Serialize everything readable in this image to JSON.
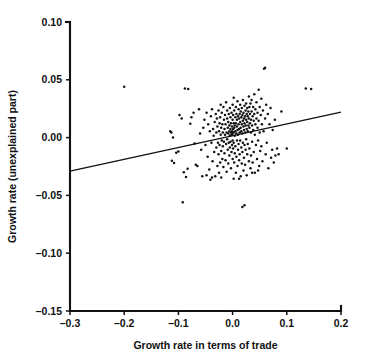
{
  "chart_data": {
    "type": "scatter",
    "title": "",
    "xlabel": "Growth rate in terms of trade",
    "ylabel": "Growth rate (unexplained part)",
    "xlim": [
      -0.3,
      0.2
    ],
    "ylim": [
      -0.15,
      0.1
    ],
    "grid": false,
    "legend": null,
    "xticks": [
      -0.3,
      -0.2,
      -0.1,
      0.0,
      0.1,
      0.2
    ],
    "xtick_labels": [
      "–0.3",
      "–0.2",
      "–0.1",
      "0.0",
      "0.1",
      "0.2"
    ],
    "yticks": [
      0.1,
      0.05,
      0.0,
      -0.05,
      -0.1,
      -0.15
    ],
    "ytick_labels": [
      "0.10",
      "0.05",
      "0.00",
      "–0.05",
      "–0.10",
      "–0.15"
    ],
    "series": [
      {
        "name": "observations",
        "marker": "dot",
        "color": "#121212",
        "points": [
          [
            -0.2,
            0.044
          ],
          [
            -0.092,
            -0.056
          ],
          [
            -0.088,
            0.0425
          ],
          [
            -0.082,
            0.042
          ],
          [
            -0.113,
            0.0045
          ],
          [
            -0.11,
            0.0
          ],
          [
            -0.112,
            -0.02
          ],
          [
            -0.108,
            -0.022
          ],
          [
            -0.104,
            -0.013
          ],
          [
            -0.1,
            -0.012
          ],
          [
            -0.098,
            0.0195
          ],
          [
            -0.094,
            0.0165
          ],
          [
            -0.09,
            -0.03
          ],
          [
            -0.086,
            -0.034
          ],
          [
            -0.083,
            -0.027
          ],
          [
            -0.078,
            0.012
          ],
          [
            -0.076,
            0.0175
          ],
          [
            -0.072,
            0.0215
          ],
          [
            -0.07,
            -0.005
          ],
          [
            -0.068,
            -0.0235
          ],
          [
            -0.065,
            -0.0245
          ],
          [
            -0.062,
            0.0245
          ],
          [
            -0.06,
            0.0035
          ],
          [
            -0.058,
            -0.0105
          ],
          [
            -0.056,
            -0.0335
          ],
          [
            -0.054,
            0.0085
          ],
          [
            -0.052,
            0.0155
          ],
          [
            -0.05,
            -0.0065
          ],
          [
            -0.048,
            0.0215
          ],
          [
            -0.046,
            -0.0165
          ],
          [
            -0.045,
            0.0115
          ],
          [
            -0.043,
            -0.0275
          ],
          [
            -0.042,
            0.0055
          ],
          [
            -0.04,
            0.0185
          ],
          [
            -0.039,
            -0.0045
          ],
          [
            -0.038,
            0.0245
          ],
          [
            -0.037,
            -0.0205
          ],
          [
            -0.036,
            0.0075
          ],
          [
            -0.035,
            0.0015
          ],
          [
            -0.034,
            -0.0125
          ],
          [
            -0.033,
            0.0135
          ],
          [
            -0.032,
            -0.0335
          ],
          [
            -0.031,
            0.0205
          ],
          [
            -0.03,
            0.0045
          ],
          [
            -0.03,
            -0.0085
          ],
          [
            -0.029,
            0.0165
          ],
          [
            -0.028,
            -0.0245
          ],
          [
            -0.028,
            0.0095
          ],
          [
            -0.027,
            -0.0045
          ],
          [
            -0.026,
            0.0235
          ],
          [
            -0.026,
            -0.0145
          ],
          [
            -0.025,
            0.0055
          ],
          [
            -0.025,
            -0.0305
          ],
          [
            -0.024,
            0.0125
          ],
          [
            -0.024,
            -0.0065
          ],
          [
            -0.023,
            0.0175
          ],
          [
            -0.023,
            -0.0215
          ],
          [
            -0.022,
            0.0025
          ],
          [
            -0.022,
            0.0285
          ],
          [
            -0.021,
            -0.0115
          ],
          [
            -0.021,
            0.0085
          ],
          [
            -0.02,
            -0.0025
          ],
          [
            -0.02,
            0.0215
          ],
          [
            -0.019,
            -0.0185
          ],
          [
            -0.019,
            0.0115
          ],
          [
            -0.018,
            0.0045
          ],
          [
            -0.018,
            -0.0075
          ],
          [
            -0.017,
            0.0265
          ],
          [
            -0.017,
            -0.0255
          ],
          [
            -0.016,
            0.0155
          ],
          [
            -0.016,
            -0.0035
          ],
          [
            -0.015,
            0.0075
          ],
          [
            -0.015,
            -0.0135
          ],
          [
            -0.014,
            0.0195
          ],
          [
            -0.014,
            0.0025
          ],
          [
            -0.013,
            -0.0195
          ],
          [
            -0.013,
            0.0115
          ],
          [
            -0.012,
            -0.0055
          ],
          [
            -0.012,
            0.0305
          ],
          [
            -0.011,
            0.0045
          ],
          [
            -0.011,
            -0.0295
          ],
          [
            -0.01,
            0.0165
          ],
          [
            -0.01,
            -0.0015
          ],
          [
            -0.01,
            0.0235
          ],
          [
            -0.009,
            -0.0105
          ],
          [
            -0.009,
            0.0085
          ],
          [
            -0.008,
            0.0035
          ],
          [
            -0.008,
            -0.0225
          ],
          [
            -0.008,
            0.0135
          ],
          [
            -0.007,
            -0.0045
          ],
          [
            -0.007,
            0.0205
          ],
          [
            -0.006,
            0.0055
          ],
          [
            -0.006,
            -0.0155
          ],
          [
            -0.006,
            0.0105
          ],
          [
            -0.005,
            0.0015
          ],
          [
            -0.005,
            0.0255
          ],
          [
            -0.005,
            -0.0085
          ],
          [
            -0.004,
            0.0075
          ],
          [
            -0.004,
            0.0175
          ],
          [
            -0.004,
            -0.0035
          ],
          [
            -0.003,
            0.0045
          ],
          [
            -0.003,
            0.0125
          ],
          [
            -0.003,
            -0.0265
          ],
          [
            -0.002,
            0.0215
          ],
          [
            -0.002,
            0.0025
          ],
          [
            -0.002,
            -0.0125
          ],
          [
            -0.001,
            0.0095
          ],
          [
            -0.001,
            0.0055
          ],
          [
            -0.001,
            -0.0065
          ],
          [
            0.0,
            0.0155
          ],
          [
            0.0,
            0.0035
          ],
          [
            0.0,
            -0.0025
          ],
          [
            0.0,
            0.0285
          ],
          [
            0.0,
            -0.0185
          ],
          [
            0.001,
            0.0075
          ],
          [
            0.001,
            0.0195
          ],
          [
            0.001,
            -0.0095
          ],
          [
            0.002,
            0.0045
          ],
          [
            0.002,
            0.0125
          ],
          [
            0.002,
            -0.0045
          ],
          [
            0.002,
            0.0345
          ],
          [
            0.003,
            0.0085
          ],
          [
            0.003,
            -0.0215
          ],
          [
            0.003,
            0.0235
          ],
          [
            0.004,
            0.0015
          ],
          [
            0.004,
            0.0105
          ],
          [
            0.004,
            -0.0135
          ],
          [
            0.005,
            0.0175
          ],
          [
            0.005,
            0.0055
          ],
          [
            0.005,
            -0.0075
          ],
          [
            0.006,
            0.0125
          ],
          [
            0.006,
            0.0265
          ],
          [
            0.006,
            -0.0305
          ],
          [
            0.007,
            0.0035
          ],
          [
            0.007,
            0.0205
          ],
          [
            0.007,
            -0.0165
          ],
          [
            0.008,
            0.0095
          ],
          [
            0.008,
            0.0155
          ],
          [
            0.008,
            -0.0025
          ],
          [
            0.009,
            0.0065
          ],
          [
            0.009,
            0.0315
          ],
          [
            0.009,
            -0.0245
          ],
          [
            0.01,
            0.0185
          ],
          [
            0.01,
            0.0025
          ],
          [
            0.01,
            -0.0105
          ],
          [
            0.011,
            0.0115
          ],
          [
            0.011,
            0.0245
          ],
          [
            0.011,
            -0.0055
          ],
          [
            0.012,
            0.0075
          ],
          [
            0.012,
            0.0165
          ],
          [
            0.012,
            -0.0195
          ],
          [
            0.013,
            0.0045
          ],
          [
            0.013,
            0.0205
          ],
          [
            0.013,
            -0.0145
          ],
          [
            0.014,
            0.0135
          ],
          [
            0.014,
            0.0285
          ],
          [
            0.014,
            -0.0025
          ],
          [
            0.015,
            0.0085
          ],
          [
            0.015,
            0.0225
          ],
          [
            0.015,
            -0.0335
          ],
          [
            0.016,
            0.0175
          ],
          [
            0.016,
            0.0055
          ],
          [
            0.016,
            -0.0085
          ],
          [
            0.017,
            0.0115
          ],
          [
            0.017,
            0.0255
          ],
          [
            0.017,
            -0.0225
          ],
          [
            0.018,
            0.0035
          ],
          [
            0.018,
            0.0195
          ],
          [
            0.018,
            -0.0125
          ],
          [
            0.019,
            0.0145
          ],
          [
            0.019,
            0.0325
          ],
          [
            0.019,
            -0.0045
          ],
          [
            0.02,
            0.0095
          ],
          [
            0.02,
            0.0215
          ],
          [
            0.02,
            -0.0285
          ],
          [
            0.021,
            0.0165
          ],
          [
            0.021,
            0.0065
          ],
          [
            0.021,
            -0.0175
          ],
          [
            0.022,
            0.0125
          ],
          [
            0.022,
            0.0275
          ],
          [
            0.022,
            -0.0065
          ],
          [
            0.023,
            0.0185
          ],
          [
            0.023,
            0.0045
          ],
          [
            0.023,
            -0.0235
          ],
          [
            0.024,
            0.0235
          ],
          [
            0.024,
            0.0105
          ],
          [
            0.024,
            -0.0105
          ],
          [
            0.025,
            0.0155
          ],
          [
            0.025,
            0.0295
          ],
          [
            0.025,
            -0.0015
          ],
          [
            0.026,
            0.0075
          ],
          [
            0.026,
            0.0205
          ],
          [
            0.026,
            -0.0325
          ],
          [
            0.027,
            0.0135
          ],
          [
            0.027,
            0.0255
          ],
          [
            0.027,
            -0.0145
          ],
          [
            0.028,
            0.0185
          ],
          [
            0.028,
            0.0055
          ],
          [
            0.028,
            -0.0055
          ],
          [
            0.029,
            0.0225
          ],
          [
            0.029,
            0.0105
          ],
          [
            0.03,
            0.0165
          ],
          [
            0.03,
            0.0355
          ],
          [
            0.03,
            -0.0205
          ],
          [
            0.031,
            0.0085
          ],
          [
            0.031,
            0.0265
          ],
          [
            0.031,
            -0.0095
          ],
          [
            0.032,
            0.0205
          ],
          [
            0.032,
            0.0125
          ],
          [
            0.033,
            0.0295
          ],
          [
            0.033,
            -0.0265
          ],
          [
            0.034,
            0.0155
          ],
          [
            0.034,
            0.0045
          ],
          [
            0.034,
            -0.0155
          ],
          [
            0.035,
            0.0225
          ],
          [
            0.035,
            0.0325
          ],
          [
            0.036,
            0.0105
          ],
          [
            0.036,
            -0.0035
          ],
          [
            0.037,
            0.0185
          ],
          [
            0.037,
            -0.0215
          ],
          [
            0.038,
            0.0265
          ],
          [
            0.038,
            0.0065
          ],
          [
            0.039,
            0.0145
          ],
          [
            0.039,
            -0.0125
          ],
          [
            0.04,
            0.0205
          ],
          [
            0.04,
            0.0375
          ],
          [
            0.041,
            0.0025
          ],
          [
            0.041,
            -0.0305
          ],
          [
            0.042,
            0.0245
          ],
          [
            0.042,
            0.0115
          ],
          [
            0.043,
            -0.0065
          ],
          [
            0.044,
            0.0165
          ],
          [
            0.044,
            0.0305
          ],
          [
            0.045,
            -0.0185
          ],
          [
            0.046,
            0.0085
          ],
          [
            0.046,
            0.0215
          ],
          [
            0.047,
            -0.0025
          ],
          [
            0.048,
            0.0145
          ],
          [
            0.048,
            0.0415
          ],
          [
            0.049,
            -0.0245
          ],
          [
            0.05,
            0.0265
          ],
          [
            0.05,
            0.0045
          ],
          [
            0.051,
            -0.0115
          ],
          [
            0.052,
            0.0195
          ],
          [
            0.053,
            0.0335
          ],
          [
            0.053,
            -0.0075
          ],
          [
            0.054,
            0.0115
          ],
          [
            0.055,
            -0.0205
          ],
          [
            0.056,
            0.0235
          ],
          [
            0.057,
            0.0055
          ],
          [
            0.058,
            0.0595
          ],
          [
            0.06,
            0.0605
          ],
          [
            0.06,
            0.0165
          ],
          [
            0.061,
            -0.0145
          ],
          [
            0.062,
            0.0285
          ],
          [
            0.063,
            -0.0045
          ],
          [
            0.065,
            0.0205
          ],
          [
            0.066,
            -0.0265
          ],
          [
            0.068,
            0.0115
          ],
          [
            0.07,
            0.0255
          ],
          [
            0.071,
            -0.0175
          ],
          [
            0.073,
            -0.0105
          ],
          [
            0.074,
            0.0065
          ],
          [
            0.076,
            -0.0215
          ],
          [
            0.078,
            0.0155
          ],
          [
            0.079,
            -0.0155
          ],
          [
            0.082,
            -0.0095
          ],
          [
            0.018,
            -0.06
          ],
          [
            0.022,
            -0.0585
          ],
          [
            -0.041,
            -0.0365
          ],
          [
            -0.038,
            -0.0345
          ],
          [
            0.002,
            -0.0355
          ],
          [
            0.012,
            -0.0355
          ],
          [
            0.09,
            0.0225
          ],
          [
            0.1,
            -0.0095
          ],
          [
            0.135,
            0.0425
          ],
          [
            0.145,
            0.042
          ],
          [
            -0.115,
            0.0055
          ],
          [
            0.085,
            -0.0145
          ],
          [
            -0.048,
            -0.0325
          ],
          [
            -0.021,
            -0.0345
          ],
          [
            0.036,
            -0.0305
          ],
          [
            0.047,
            -0.0285
          ]
        ]
      }
    ],
    "fit_line": {
      "name": "regression-line",
      "x0": -0.3,
      "y0": -0.029,
      "x1": 0.2,
      "y1": 0.022,
      "slope": 0.102,
      "intercept": 0.0016
    }
  }
}
